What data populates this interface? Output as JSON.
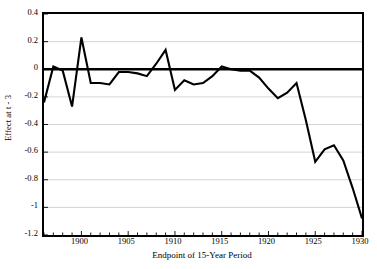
{
  "chart_data": {
    "type": "line",
    "title": "",
    "xlabel": "Endpoint of 15-Year Period",
    "ylabel": "Effect at t - 3",
    "xlim": [
      1896,
      1930
    ],
    "ylim": [
      -1.2,
      0.4
    ],
    "grid": true,
    "legend": null,
    "xticks": [
      1900,
      1905,
      1910,
      1915,
      1920,
      1925,
      1930
    ],
    "yticks": [
      0.4,
      0.2,
      0,
      -0.2,
      -0.4,
      -0.6,
      -0.8,
      -1,
      -1.2
    ],
    "ytick_labels": [
      "0.4",
      "0.2",
      "0",
      "-0.2",
      "-0.4",
      "-0.6",
      "-0.8",
      "-1",
      "-1.2"
    ],
    "xtick_labels": [
      "1900",
      "1905",
      "1910",
      "1915",
      "1920",
      "1925",
      "1930"
    ],
    "zero_line": 0,
    "line_color": "#000000",
    "grid_color": "#c8c8c8",
    "axis_color": "#000000",
    "background": "#ffffff",
    "x": [
      1896,
      1897,
      1898,
      1899,
      1900,
      1901,
      1902,
      1903,
      1904,
      1905,
      1906,
      1907,
      1908,
      1909,
      1910,
      1911,
      1912,
      1913,
      1914,
      1915,
      1916,
      1917,
      1918,
      1919,
      1920,
      1921,
      1922,
      1923,
      1924,
      1925,
      1926,
      1927,
      1928,
      1929,
      1930
    ],
    "values": [
      -0.24,
      0.02,
      -0.01,
      -0.27,
      0.23,
      -0.1,
      -0.1,
      -0.11,
      -0.02,
      -0.02,
      -0.03,
      -0.05,
      0.04,
      0.14,
      -0.15,
      -0.08,
      -0.11,
      -0.1,
      -0.05,
      0.02,
      0.0,
      -0.01,
      -0.01,
      -0.06,
      -0.14,
      -0.21,
      -0.17,
      -0.1,
      -0.37,
      -0.67,
      -0.58,
      -0.55,
      -0.66,
      -0.86,
      -1.08
    ]
  },
  "axes": {
    "ylabel_text": "Effect at t - 3",
    "xlabel_text": "Endpoint of 15-Year Period"
  }
}
